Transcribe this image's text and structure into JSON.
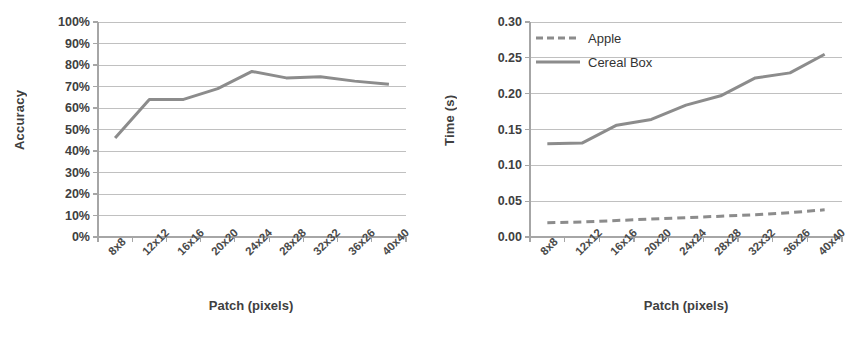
{
  "figure": {
    "background": "#ffffff",
    "line_color": "#8c8c8c",
    "grid_color": "#c0c0c0",
    "axis_color": "#a6a6a6",
    "text_color": "#404040"
  },
  "chart_data": [
    {
      "type": "line",
      "panel": "left",
      "title": "",
      "xlabel": "Patch (pixels)",
      "ylabel": "Accuracy",
      "categories": [
        "8x8",
        "12x12",
        "16x16",
        "20x20",
        "24x24",
        "28x28",
        "32x32",
        "36x26",
        "40x40"
      ],
      "ytick_labels": [
        "0%",
        "10%",
        "20%",
        "30%",
        "40%",
        "50%",
        "60%",
        "70%",
        "80%",
        "90%",
        "100%"
      ],
      "ytick_values": [
        0,
        10,
        20,
        30,
        40,
        50,
        60,
        70,
        80,
        90,
        100
      ],
      "ylim": [
        0,
        100
      ],
      "grid": true,
      "legend": false,
      "series": [
        {
          "name": "Accuracy",
          "style": "solid",
          "color": "#8c8c8c",
          "values": [
            46,
            64,
            64,
            69,
            77,
            74,
            74.5,
            72.5,
            71
          ]
        }
      ]
    },
    {
      "type": "line",
      "panel": "right",
      "title": "",
      "xlabel": "Patch (pixels)",
      "ylabel": "Time (s)",
      "categories": [
        "8x8",
        "12x12",
        "16x16",
        "20x20",
        "24x24",
        "28x28",
        "32x32",
        "36x26",
        "40x40"
      ],
      "ytick_labels": [
        "0.00",
        "0.05",
        "0.10",
        "0.15",
        "0.20",
        "0.25",
        "0.30"
      ],
      "ytick_values": [
        0.0,
        0.05,
        0.1,
        0.15,
        0.2,
        0.25,
        0.3
      ],
      "ylim": [
        0.0,
        0.3
      ],
      "grid": true,
      "legend": true,
      "legend_position": "top-left",
      "series": [
        {
          "name": "Apple",
          "style": "dashed",
          "color": "#8c8c8c",
          "values": [
            0.02,
            0.021,
            0.023,
            0.025,
            0.027,
            0.029,
            0.031,
            0.034,
            0.038
          ]
        },
        {
          "name": "Cereal Box",
          "style": "solid",
          "color": "#8c8c8c",
          "values": [
            0.13,
            0.131,
            0.156,
            0.164,
            0.184,
            0.197,
            0.222,
            0.229,
            0.255
          ]
        }
      ]
    }
  ],
  "left_panel": {
    "y_axis_title": "Accuracy",
    "x_axis_title": "Patch (pixels)"
  },
  "right_panel": {
    "y_axis_title": "Time (s)",
    "x_axis_title": "Patch (pixels)",
    "legend": {
      "apple_label": "Apple",
      "cereal_label": "Cereal Box"
    }
  }
}
